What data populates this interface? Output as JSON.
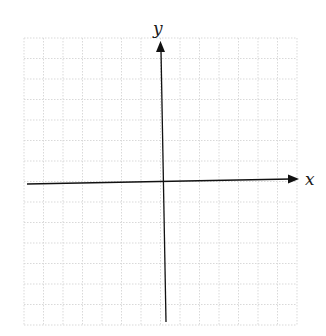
{
  "diagram": {
    "type": "coordinate-plane",
    "x_axis_label": "x",
    "y_axis_label": "y",
    "grid": {
      "left": 24,
      "top": 38,
      "right": 297,
      "bottom": 325,
      "columns": 14,
      "rows": 14,
      "line_color": "#d9d9d9",
      "line_style": "dotted"
    },
    "origin": {
      "x": 162,
      "y": 181
    },
    "axis_color": "#111111"
  }
}
